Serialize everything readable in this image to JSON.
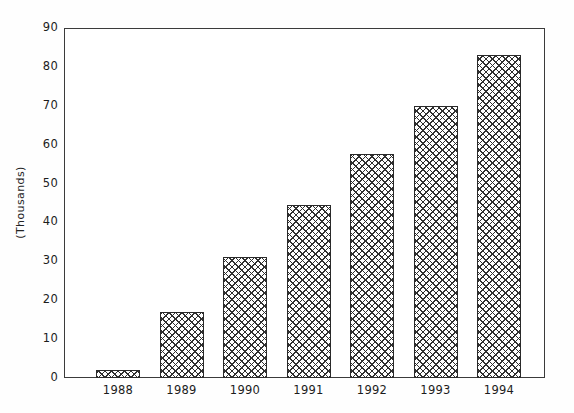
{
  "chart_data": {
    "type": "bar",
    "title": "",
    "xlabel": "",
    "ylabel": "(Thousands)",
    "categories": [
      "1988",
      "1989",
      "1990",
      "1991",
      "1992",
      "1993",
      "1994"
    ],
    "values": [
      2,
      17,
      31,
      44.5,
      57.5,
      70,
      83
    ],
    "ylim": [
      0,
      90
    ],
    "ytick_labels": [
      "0",
      "10",
      "20",
      "30",
      "40",
      "50",
      "60",
      "70",
      "80",
      "90"
    ],
    "ytick_values": [
      0,
      10,
      20,
      30,
      40,
      50,
      60,
      70,
      80,
      90
    ],
    "grid": false,
    "legend": null,
    "series": [
      {
        "name": "",
        "values": [
          2,
          17,
          31,
          44.5,
          57.5,
          70,
          83
        ]
      }
    ],
    "bar_fill": "crosshatch",
    "colors": {
      "axis": "#3b3b3b",
      "bar_outline": "#2a2a2a",
      "bar_hatch": "#2f2f2f",
      "background": "#ffffff",
      "text": "#1c1c1c"
    }
  }
}
